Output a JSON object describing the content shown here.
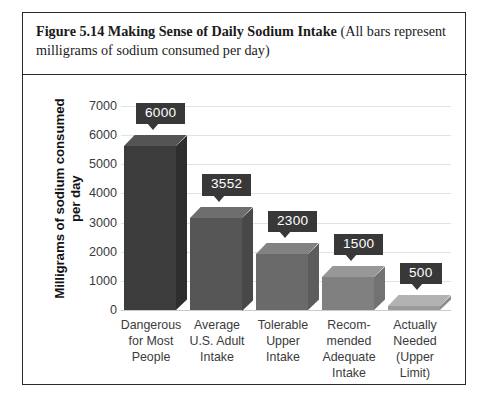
{
  "figure": {
    "caption_bold": "Figure 5.14 Making Sense of Daily Sodium Intake",
    "caption_rest": " (All bars represent milligrams of sodium consumed per day)"
  },
  "chart_data": {
    "type": "bar",
    "title": "Figure 5.14 Making Sense of Daily Sodium Intake",
    "subtitle": "(All bars represent milligrams of sodium consumed per day)",
    "xlabel": "",
    "ylabel": "Milligrams of sodium consumed per day",
    "ylim": [
      0,
      7000
    ],
    "ytick_labels": [
      "7000",
      "6000",
      "5000",
      "4000",
      "3000",
      "2000",
      "1000",
      "0"
    ],
    "ytick_values": [
      7000,
      6000,
      5000,
      4000,
      3000,
      2000,
      1000,
      0
    ],
    "grid": true,
    "legend": "none",
    "three_d": true,
    "categories": [
      "Dangerous for Most People",
      "Average U.S. Adult Intake",
      "Tolerable Upper Intake",
      "Recommended Adequate Intake",
      "Actually Needed (Upper Limit)"
    ],
    "category_lines": [
      [
        "Dangerous",
        "for Most",
        "People"
      ],
      [
        "Average",
        "U.S. Adult",
        "Intake"
      ],
      [
        "Tolerable",
        "Upper",
        "Intake"
      ],
      [
        "Recom-",
        "mended",
        "Adequate",
        "Intake"
      ],
      [
        "Actually",
        "Needed",
        "(Upper",
        "Limit)"
      ]
    ],
    "values": [
      6000,
      3552,
      2300,
      1500,
      500
    ],
    "data_labels": [
      "6000",
      "3552",
      "2300",
      "1500",
      "500"
    ],
    "bar_colors": [
      "#3c3c3c",
      "#565656",
      "#6a6a6a",
      "#808080",
      "#9a9a9a"
    ],
    "label_box_color": "#383838",
    "label_text_color": "#ffffff",
    "grid_color": "#e2e2e2",
    "axis_text_color": "#3b3b3b"
  }
}
